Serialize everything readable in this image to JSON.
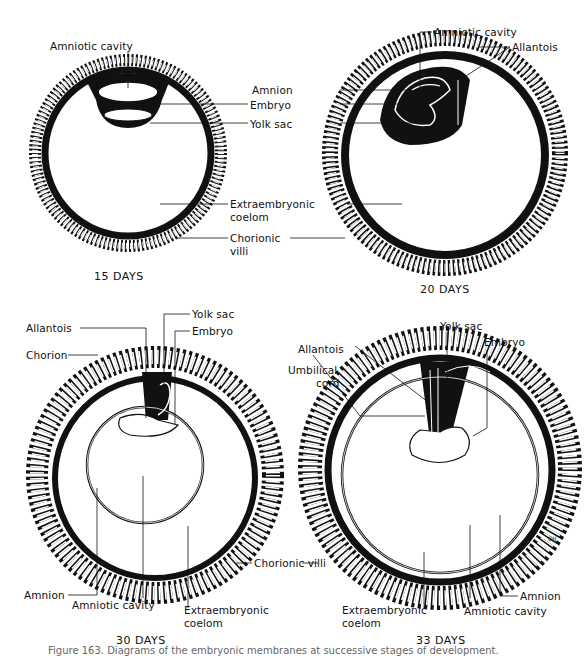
{
  "figure": {
    "panels": [
      {
        "id": "day15",
        "title": "15 DAYS",
        "labels": {
          "amniotic_cavity": "Amniotic cavity",
          "amnion": "Amnion",
          "embryo": "Embryo",
          "yolk_sac": "Yolk sac",
          "extraembryonic_coelom_1": "Extraembryonic",
          "extraembryonic_coelom_2": "coelom",
          "chorionic_villi_1": "Chorionic",
          "chorionic_villi_2": "villi"
        }
      },
      {
        "id": "day20",
        "title": "20 DAYS",
        "labels": {
          "amniotic_cavity": "Amniotic cavity",
          "allantois": "Allantois"
        }
      },
      {
        "id": "day30",
        "title": "30 DAYS",
        "labels": {
          "allantois": "Allantois",
          "chorion": "Chorion",
          "yolk_sac": "Yolk sac",
          "embryo": "Embryo",
          "amnion": "Amnion",
          "amniotic_cavity": "Amniotic cavity",
          "extraembryonic_coelom_1": "Extraembryonic",
          "extraembryonic_coelom_2": "coelom",
          "chorionic_villi": "Chorionic  villi"
        }
      },
      {
        "id": "day33",
        "title": "33 DAYS",
        "labels": {
          "allantois": "Allantois",
          "umbilical_cord_1": "Umbilical",
          "umbilical_cord_2": "cord",
          "yolk_sac": "Yolk sac",
          "embryo": "Embryo",
          "amnion": "Amnion",
          "amniotic_cavity": "Amniotic cavity",
          "extraembryonic_coelom_1": "Extraembryonic",
          "extraembryonic_coelom_2": "coelom",
          "artist_mark": "OJI"
        }
      }
    ],
    "caption": "Figure 163.  Diagrams of the embryonic membranes at successive stages of development."
  }
}
